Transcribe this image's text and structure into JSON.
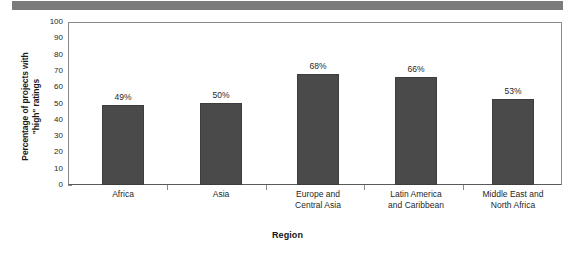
{
  "chart_data": {
    "type": "bar",
    "title": "",
    "xlabel": "Region",
    "ylabel": "Percentage of projects with \"high\" ratings",
    "ylabel_lines": [
      "Percentage of projects with",
      "\"high\" ratings"
    ],
    "categories": [
      "Africa",
      "Asia",
      "Europe and Central Asia",
      "Latin America and Caribbean",
      "Middle East and North Africa"
    ],
    "category_lines": [
      [
        "Africa"
      ],
      [
        "Asia"
      ],
      [
        "Europe and",
        "Central Asia"
      ],
      [
        "Latin America",
        "and Caribbean"
      ],
      [
        "Middle East and",
        "North Africa"
      ]
    ],
    "values": [
      49,
      50,
      68,
      66,
      53
    ],
    "value_labels": [
      "49%",
      "50%",
      "68%",
      "66%",
      "53%"
    ],
    "ylim": [
      0,
      100
    ],
    "ytick_values": [
      100,
      90,
      80,
      70,
      60,
      50,
      40,
      30,
      20,
      10,
      0
    ],
    "ytick_labels": [
      "100",
      "90",
      "80",
      "70",
      "60",
      "50",
      "40",
      "30",
      "20",
      "10",
      "0"
    ],
    "grid": false,
    "legend": "none",
    "bar_color": "#4a4a4a",
    "axis_color": "#8a8a8a",
    "banner_color": "#7b7b7b",
    "background_color": "#ffffff"
  }
}
